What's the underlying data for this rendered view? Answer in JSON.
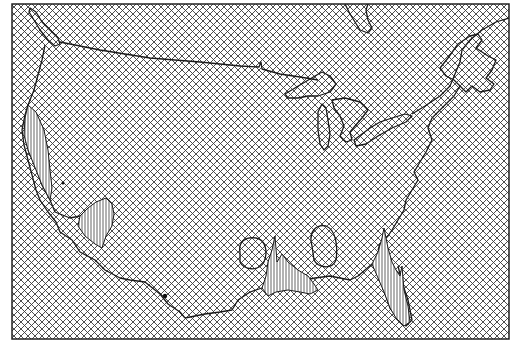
{
  "figure": {
    "type": "map",
    "region": "Contiguous United States with surrounding Canada, Mexico and Gulf coast",
    "frame": {
      "x": 12,
      "y": 4,
      "width": 497,
      "height": 335
    },
    "background_fill": "crosshatch",
    "line_color": "#1a1a1a",
    "background_color": "#ffffff",
    "hatch_spacing": 7,
    "features": [
      {
        "name": "us-canada-border",
        "style": "line"
      },
      {
        "name": "great-lakes",
        "style": "outline"
      },
      {
        "name": "pacific-coast",
        "style": "outline"
      },
      {
        "name": "gulf-coast",
        "style": "outline"
      },
      {
        "name": "atlantic-coast",
        "style": "outline"
      },
      {
        "name": "hudson-bay-outline",
        "style": "outline"
      },
      {
        "name": "gulf-of-st-lawrence",
        "style": "outline"
      }
    ],
    "highlighted_regions": [
      {
        "name": "california-coast-peak",
        "shading": "vertical-lines"
      },
      {
        "name": "sonora-baja-peak",
        "shading": "vertical-lines"
      },
      {
        "name": "texas-louisiana-peaks",
        "shading": "vertical-lines"
      },
      {
        "name": "florida-peak",
        "shading": "vertical-lines"
      },
      {
        "name": "texas-loop-contour",
        "shading": "none"
      },
      {
        "name": "mississippi-loop-contour",
        "shading": "none"
      }
    ],
    "markers": [
      {
        "name": "dot-nevada",
        "x": 63,
        "y": 183
      },
      {
        "name": "dot-pacific-mexico",
        "x": 165,
        "y": 296
      }
    ]
  }
}
